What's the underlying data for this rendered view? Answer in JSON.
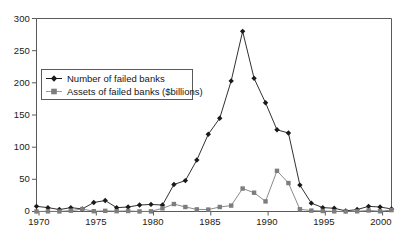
{
  "chart_data": {
    "type": "line",
    "title": "",
    "subtitle": "",
    "xlabel": "",
    "ylabel": "",
    "xlim": [
      1970,
      2001
    ],
    "ylim": [
      0,
      300
    ],
    "grid": false,
    "legend_position": "upper-left-inside",
    "xticks": [
      "1970",
      "1975",
      "1980",
      "1985",
      "1990",
      "1995",
      "2000"
    ],
    "xtick_values": [
      1970,
      1975,
      1980,
      1985,
      1990,
      1995,
      2000
    ],
    "yticks": [
      "0",
      "50",
      "100",
      "150",
      "200",
      "250",
      "300"
    ],
    "ytick_values": [
      0,
      50,
      100,
      150,
      200,
      250,
      300
    ],
    "x": [
      1970,
      1971,
      1972,
      1973,
      1974,
      1975,
      1976,
      1977,
      1978,
      1979,
      1980,
      1981,
      1982,
      1983,
      1984,
      1985,
      1986,
      1987,
      1988,
      1989,
      1990,
      1991,
      1992,
      1993,
      1994,
      1995,
      1996,
      1997,
      1998,
      1999,
      2000,
      2001
    ],
    "series": [
      {
        "name": "Number of failed banks",
        "marker": "diamond",
        "color": "#1a1a1a",
        "values": [
          8,
          6,
          3,
          6,
          4,
          14,
          17,
          6,
          7,
          10,
          11,
          10,
          42,
          48,
          80,
          120,
          145,
          203,
          280,
          207,
          169,
          127,
          122,
          41,
          13,
          6,
          5,
          1,
          3,
          8,
          7,
          4
        ]
      },
      {
        "name": "Assets of failed banks ($billions)",
        "marker": "square",
        "color": "#7d7d7d",
        "values": [
          0.1,
          0.2,
          0.1,
          1.3,
          3.8,
          0.4,
          1.0,
          0.5,
          0.8,
          0.1,
          0.2,
          4.9,
          11.6,
          7.0,
          3.3,
          3.0,
          7.0,
          9.2,
          35.7,
          29.2,
          15.7,
          63.2,
          44.2,
          3.5,
          1.4,
          0.8,
          0.2,
          0.03,
          0.3,
          1.6,
          0.4,
          2.2
        ]
      }
    ],
    "annotations": []
  },
  "legend": {
    "items": [
      {
        "label": "Number of failed banks",
        "marker": "diamond"
      },
      {
        "label": "Assets of failed banks ($billions)",
        "marker": "square"
      }
    ]
  },
  "axes": {
    "y_labels": [
      "300",
      "250",
      "200",
      "150",
      "100",
      "50",
      "0"
    ],
    "x_labels": [
      "1970",
      "1975",
      "1980",
      "1985",
      "1990",
      "1995",
      "2000"
    ]
  }
}
